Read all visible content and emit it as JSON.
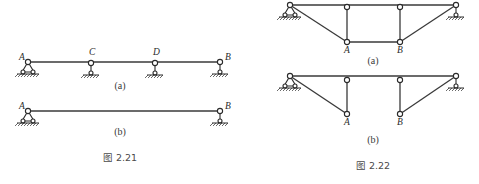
{
  "figures": [
    {
      "id": "fig-2-21",
      "caption": "图 2.21",
      "caption_pos": [
        120,
        161
      ],
      "subfigures": [
        {
          "label": "(a)",
          "label_pos": [
            120,
            89
          ],
          "description": "Continuous beam A–C–D–B with pin support at A and roller/link supports at C, D, B",
          "nodes": [
            {
              "name": "A",
              "x": 28,
              "y": 62,
              "support": "pin",
              "label_dx": -9,
              "label_dy": -2
            },
            {
              "name": "C",
              "x": 91,
              "y": 63,
              "support": "link",
              "label_dx": -2,
              "label_dy": -8
            },
            {
              "name": "D",
              "x": 155,
              "y": 63,
              "support": "link",
              "label_dx": -2,
              "label_dy": -8
            },
            {
              "name": "B",
              "x": 220,
              "y": 62,
              "support": "link",
              "label_dx": 5,
              "label_dy": -2
            }
          ],
          "members": [
            [
              "A",
              "B"
            ]
          ]
        },
        {
          "label": "(b)",
          "label_pos": [
            120,
            135
          ],
          "description": "Simply supported beam A–B with pin support at A and link support at B",
          "nodes": [
            {
              "name": "A",
              "x": 28,
              "y": 111,
              "support": "pin",
              "label_dx": -9,
              "label_dy": -2
            },
            {
              "name": "B",
              "x": 220,
              "y": 111,
              "support": "link",
              "label_dx": 5,
              "label_dy": -2
            }
          ],
          "members": [
            [
              "A",
              "B"
            ]
          ]
        }
      ]
    },
    {
      "id": "fig-2-22",
      "caption": "图 2.22",
      "caption_pos": [
        373,
        169
      ],
      "subfigures": [
        {
          "label": "(a)",
          "label_pos": [
            373,
            64
          ],
          "description": "Trussed beam with lower chord A–B connected by vertical posts and inclined ties",
          "nodes": [
            {
              "name": "L",
              "x": 290,
              "y": 5,
              "support": "pin",
              "show_label": false
            },
            {
              "name": "T1",
              "x": 347,
              "y": 7,
              "support": "none",
              "show_label": false
            },
            {
              "name": "T2",
              "x": 400,
              "y": 7,
              "support": "none",
              "show_label": false
            },
            {
              "name": "R",
              "x": 456,
              "y": 5,
              "support": "link",
              "show_label": false
            },
            {
              "name": "A",
              "x": 347,
              "y": 42,
              "support": "none",
              "label_dx": -3,
              "label_dy": 11
            },
            {
              "name": "B",
              "x": 400,
              "y": 42,
              "support": "none",
              "label_dx": -3,
              "label_dy": 11
            }
          ],
          "members": [
            [
              "L",
              "R"
            ],
            [
              "L",
              "A"
            ],
            [
              "T1",
              "A"
            ],
            [
              "A",
              "B"
            ],
            [
              "T2",
              "B"
            ],
            [
              "B",
              "R"
            ]
          ]
        },
        {
          "label": "(b)",
          "label_pos": [
            373,
            143
          ],
          "description": "Same trussed beam without lower chord between A and B",
          "nodes": [
            {
              "name": "L",
              "x": 290,
              "y": 76,
              "support": "pin",
              "show_label": false
            },
            {
              "name": "T1",
              "x": 347,
              "y": 80,
              "support": "none",
              "show_label": false
            },
            {
              "name": "T2",
              "x": 400,
              "y": 80,
              "support": "none",
              "show_label": false
            },
            {
              "name": "R",
              "x": 456,
              "y": 76,
              "support": "link",
              "show_label": false
            },
            {
              "name": "A",
              "x": 347,
              "y": 114,
              "support": "none",
              "label_dx": -3,
              "label_dy": 11
            },
            {
              "name": "B",
              "x": 400,
              "y": 114,
              "support": "none",
              "label_dx": -3,
              "label_dy": 11
            }
          ],
          "members": [
            [
              "L",
              "R"
            ],
            [
              "L",
              "A"
            ],
            [
              "T1",
              "A"
            ],
            [
              "T2",
              "B"
            ],
            [
              "B",
              "R"
            ]
          ]
        }
      ]
    }
  ]
}
